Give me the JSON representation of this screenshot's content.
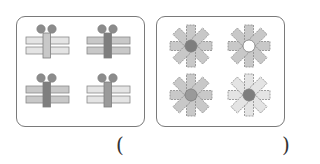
{
  "colors": {
    "border": "#7a7a7a",
    "stroke": "#8a8a8a",
    "light": "#e4e4e4",
    "mid": "#c8c8c8",
    "dark": "#9a9a9a",
    "darker": "#7e7e7e",
    "circle": "#8c8c8c",
    "white": "#ffffff"
  },
  "panels": [
    {
      "id": "gifts",
      "figures": [
        {
          "cx": 47,
          "cy": 45,
          "bars": "light",
          "ribbon": "mid",
          "dots": "circle"
        },
        {
          "cx": 108,
          "cy": 45,
          "bars": "mid",
          "ribbon": "darker",
          "dots": "circle"
        },
        {
          "cx": 47,
          "cy": 94,
          "bars": "mid",
          "ribbon": "darker",
          "dots": "circle"
        },
        {
          "cx": 108,
          "cy": 94,
          "bars": "light",
          "ribbon": "dark",
          "dots": "circle"
        }
      ]
    },
    {
      "id": "flowers",
      "figures": [
        {
          "cx": 191,
          "cy": 46,
          "petals": "mid",
          "center": "darker"
        },
        {
          "cx": 249,
          "cy": 46,
          "petals": "mid",
          "center": "white"
        },
        {
          "cx": 191,
          "cy": 95,
          "petals": "mid",
          "center": "dark"
        },
        {
          "cx": 249,
          "cy": 95,
          "petals": "light",
          "center": "darker"
        }
      ]
    }
  ],
  "answer": {
    "open_paren": "(",
    "close_paren": ")",
    "value": ""
  }
}
